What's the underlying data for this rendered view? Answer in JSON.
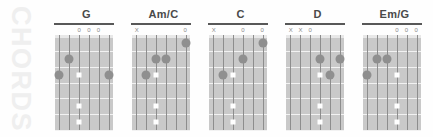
{
  "watermark": {
    "label": "CHORDS"
  },
  "diagram": {
    "strings": 6,
    "frets": 6,
    "marker_open": "0",
    "marker_muted": "X",
    "marker_none": "",
    "colors": {
      "fretboard": "#c9c9c9",
      "string": "#8d8d8d",
      "fret": "#f2f2f2",
      "dot": "#8f8f8f",
      "square": "#ffffff",
      "title": "#4a4a4a",
      "rule": "#585858",
      "watermark": "#efefef",
      "background": "#fefefe"
    }
  },
  "chords": [
    {
      "name": "G",
      "markers": [
        "",
        "",
        "0",
        "0",
        "0",
        ""
      ],
      "dots": [
        {
          "string": 2,
          "fret": 2
        },
        {
          "string": 1,
          "fret": 3
        },
        {
          "string": 6,
          "fret": 3
        }
      ],
      "squares": [
        {
          "string": 3,
          "fret": 3
        },
        {
          "string": 3,
          "fret": 5
        },
        {
          "string": 3,
          "fret": 6
        }
      ]
    },
    {
      "name": "Am/C",
      "markers": [
        "X",
        "",
        "",
        "",
        "",
        "0"
      ],
      "dots": [
        {
          "string": 6,
          "fret": 1
        },
        {
          "string": 3,
          "fret": 2
        },
        {
          "string": 4,
          "fret": 2
        },
        {
          "string": 2,
          "fret": 3
        }
      ],
      "squares": [
        {
          "string": 3,
          "fret": 3
        },
        {
          "string": 3,
          "fret": 5
        },
        {
          "string": 3,
          "fret": 6
        }
      ]
    },
    {
      "name": "C",
      "markers": [
        "X",
        "",
        "",
        "0",
        "",
        "0"
      ],
      "dots": [
        {
          "string": 6,
          "fret": 1
        },
        {
          "string": 4,
          "fret": 2
        },
        {
          "string": 2,
          "fret": 3
        }
      ],
      "squares": [
        {
          "string": 3,
          "fret": 3
        },
        {
          "string": 3,
          "fret": 5
        },
        {
          "string": 3,
          "fret": 6
        }
      ]
    },
    {
      "name": "D",
      "markers": [
        "X",
        "X",
        "0",
        "",
        "",
        ""
      ],
      "dots": [
        {
          "string": 4,
          "fret": 2
        },
        {
          "string": 6,
          "fret": 2
        },
        {
          "string": 5,
          "fret": 3
        }
      ],
      "squares": [
        {
          "string": 4,
          "fret": 3
        },
        {
          "string": 4,
          "fret": 5
        },
        {
          "string": 4,
          "fret": 6
        }
      ]
    },
    {
      "name": "Em/G",
      "markers": [
        "",
        "",
        "",
        "0",
        "0",
        "0"
      ],
      "dots": [
        {
          "string": 2,
          "fret": 2
        },
        {
          "string": 3,
          "fret": 2
        },
        {
          "string": 1,
          "fret": 3
        }
      ],
      "squares": [
        {
          "string": 4,
          "fret": 3
        },
        {
          "string": 4,
          "fret": 5
        },
        {
          "string": 4,
          "fret": 6
        }
      ]
    }
  ]
}
